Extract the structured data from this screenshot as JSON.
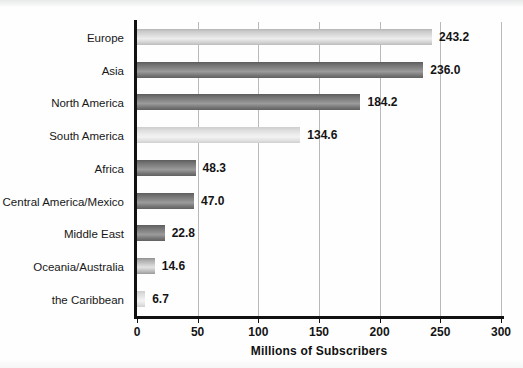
{
  "chart_data": {
    "type": "bar",
    "orientation": "horizontal",
    "title": "",
    "xlabel": "Millions of Subscribers",
    "ylabel": "",
    "xlim": [
      0,
      300
    ],
    "xticks": [
      0,
      50,
      100,
      150,
      200,
      250,
      300
    ],
    "xtick_labels": [
      "0",
      "50",
      "100",
      "150",
      "200",
      "250",
      "300"
    ],
    "grid": true,
    "grid_axis": "x",
    "legend": "none",
    "categories": [
      "Europe",
      "Asia",
      "North America",
      "South America",
      "Africa",
      "Central America/Mexico",
      "Middle East",
      "Oceania/Australia",
      "the Caribbean"
    ],
    "values": [
      243.2,
      236.0,
      184.2,
      134.6,
      48.3,
      47.0,
      22.8,
      14.6,
      6.7
    ],
    "value_labels": [
      "243.2",
      "236.0",
      "184.2",
      "134.6",
      "48.3",
      "47.0",
      "22.8",
      "14.6",
      "6.7"
    ],
    "bar_shades": [
      "light",
      "dark",
      "dark",
      "xlight",
      "dark",
      "dark",
      "dark",
      "mid",
      "xlight"
    ],
    "colors": {
      "bar_light": "#e2e2e2",
      "bar_mid": "#a9a9a9",
      "bar_dark": "#6e6e6e",
      "axis": "#111111",
      "gridline": "#b9b9b9",
      "text": "#141414",
      "background": "#fefefe"
    }
  }
}
